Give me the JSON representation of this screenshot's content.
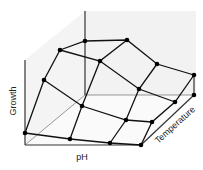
{
  "diagram": {
    "type": "3d-surface-mesh",
    "axes": {
      "vertical": "Growth",
      "horizontal": "pH",
      "depth": "Temperature"
    },
    "colors": {
      "line": "#111111",
      "node": "#000000",
      "wall_shade": "#f0f0f0",
      "background": "#ffffff"
    },
    "nodes": [
      {
        "id": "r0c0",
        "x": 60,
        "y": 50
      },
      {
        "id": "r0c1",
        "x": 85,
        "y": 41
      },
      {
        "id": "r0c2",
        "x": 127,
        "y": 40
      },
      {
        "id": "r0c3",
        "x": 157,
        "y": 64
      },
      {
        "id": "r0c4",
        "x": 194,
        "y": 75
      },
      {
        "id": "r1c0",
        "x": 44,
        "y": 80
      },
      {
        "id": "r1c1",
        "x": 100,
        "y": 61
      },
      {
        "id": "r1c2",
        "x": 139,
        "y": 89
      },
      {
        "id": "r1c3",
        "x": 175,
        "y": 102
      },
      {
        "id": "r1c4",
        "x": 194,
        "y": 95
      },
      {
        "id": "r2c0",
        "x": 25,
        "y": 133
      },
      {
        "id": "r2c1",
        "x": 82,
        "y": 106
      },
      {
        "id": "r2c2",
        "x": 126,
        "y": 120
      },
      {
        "id": "r2c3",
        "x": 152,
        "y": 122
      },
      {
        "id": "r3c1",
        "x": 70,
        "y": 139
      },
      {
        "id": "r3c2",
        "x": 110,
        "y": 143
      },
      {
        "id": "r3c3",
        "x": 141,
        "y": 145
      }
    ]
  }
}
